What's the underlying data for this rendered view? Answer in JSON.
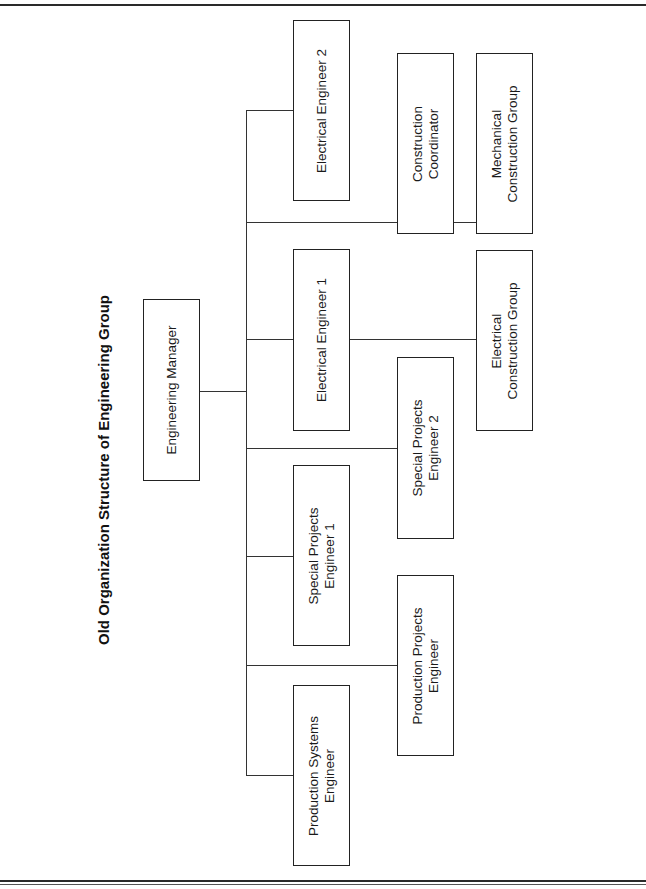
{
  "chart_title": "Old Organization Structure of Engineering Group",
  "nodes": {
    "engineering_manager": "Engineering Manager",
    "electrical_engineer_2": "Electrical Engineer 2",
    "electrical_engineer_1": "Electrical Engineer 1",
    "special_projects_engineer_1": {
      "line1": "Special Projects",
      "line2": "Engineer 1"
    },
    "production_systems_engineer": {
      "line1": "Production Systems",
      "line2": "Engineer"
    },
    "construction_coordinator": {
      "line1": "Construction",
      "line2": "Coordinator"
    },
    "special_projects_engineer_2": {
      "line1": "Special Projects",
      "line2": "Engineer 2"
    },
    "production_projects_engineer": {
      "line1": "Production Projects",
      "line2": "Engineer"
    },
    "mechanical_construction_group": {
      "line1": "Mechanical",
      "line2": "Construction Group"
    },
    "electrical_construction_group": {
      "line1": "Electrical",
      "line2": "Construction Group"
    }
  },
  "hierarchy": {
    "root": "Engineering Manager",
    "reports_to_engineering_manager": [
      "Electrical Engineer 2",
      "Construction Coordinator",
      "Electrical Engineer 1",
      "Special Projects Engineer 2",
      "Special Projects Engineer 1",
      "Production Projects Engineer",
      "Production Systems Engineer"
    ],
    "reports_to_electrical_engineer_1": [
      "Electrical Construction Group"
    ],
    "reports_to_construction_coordinator": [
      "Mechanical Construction Group"
    ]
  },
  "colors": {
    "line": "#333333",
    "border": "#222222",
    "background": "#ffffff"
  }
}
